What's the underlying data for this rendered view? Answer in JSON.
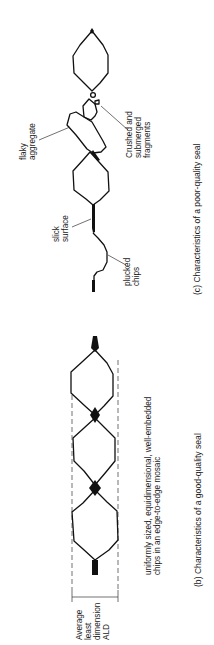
{
  "figure": {
    "orientation": "rotated-90-ccw",
    "panel_c": {
      "caption": "(c) Characteristics of a poor-quality seal",
      "labels": {
        "flaky_1": "flaky",
        "flaky_2": "aggregate",
        "crushed_1": "Crushed and",
        "crushed_2": "submerged",
        "crushed_3": "fragments",
        "slick_1": "slick",
        "slick_2": "surface",
        "plucked_1": "plucked",
        "plucked_2": "chips"
      }
    },
    "panel_b": {
      "caption": "(b) Characteristics of a good-quality seal",
      "labels": {
        "desc_1": "uniformly sized, equidimensional, well-embedded",
        "desc_2": "chips in an edge-to-edge mosaic",
        "ald_1": "Average",
        "ald_2": "least",
        "ald_3": "dimension",
        "ald_4": "ALD"
      }
    },
    "colors": {
      "ink": "#111111",
      "background": "#ffffff"
    }
  }
}
